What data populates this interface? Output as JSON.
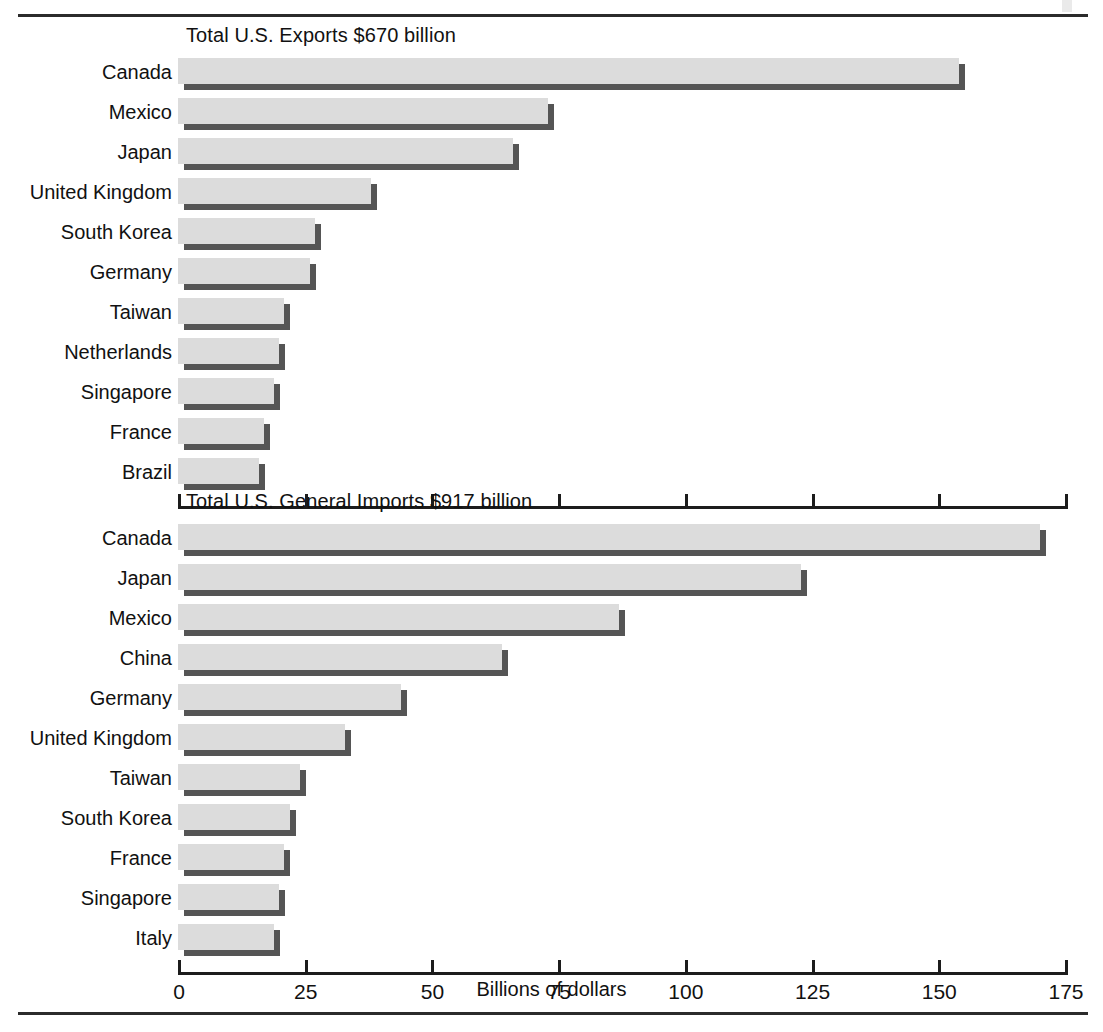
{
  "axis": {
    "title": "Billions of dollars",
    "ticks": [
      0,
      25,
      50,
      75,
      100,
      125,
      150,
      175
    ],
    "tick_labels": [
      "0",
      "25",
      "50",
      "75",
      "100",
      "125",
      "150",
      "175"
    ],
    "min": 0,
    "max": 175
  },
  "colors": {
    "bar_fill": "#dcdcdc",
    "bar_shadow": "#555555",
    "axis": "#1c1c1c",
    "rule": "#2b2b2b",
    "text": "#111111"
  },
  "charts": [
    {
      "id": "exports",
      "title": "Total U.S. Exports $670 billion",
      "total_label": "$670 billion",
      "show_tick_labels": false
    },
    {
      "id": "imports",
      "title": "Total U.S. General Imports $917 billion",
      "total_label": "$917 billion",
      "show_tick_labels": true
    }
  ],
  "chart_data": [
    {
      "type": "bar",
      "orientation": "horizontal",
      "title": "Total U.S. Exports $670 billion",
      "xlabel": "Billions of dollars",
      "ylabel": "",
      "xlim": [
        0,
        175
      ],
      "xticks": [
        0,
        25,
        50,
        75,
        100,
        125,
        150,
        175
      ],
      "grid": false,
      "legend": false,
      "categories": [
        "Canada",
        "Mexico",
        "Japan",
        "United Kingdom",
        "South Korea",
        "Germany",
        "Taiwan",
        "Netherlands",
        "Singapore",
        "France",
        "Brazil"
      ],
      "values": [
        154,
        73,
        66,
        38,
        27,
        26,
        21,
        20,
        19,
        17,
        16
      ]
    },
    {
      "type": "bar",
      "orientation": "horizontal",
      "title": "Total U.S. General Imports $917 billion",
      "xlabel": "Billions of dollars",
      "ylabel": "",
      "xlim": [
        0,
        175
      ],
      "xticks": [
        0,
        25,
        50,
        75,
        100,
        125,
        150,
        175
      ],
      "grid": false,
      "legend": false,
      "categories": [
        "Canada",
        "Japan",
        "Mexico",
        "China",
        "Germany",
        "United Kingdom",
        "Taiwan",
        "South Korea",
        "France",
        "Singapore",
        "Italy"
      ],
      "values": [
        170,
        123,
        87,
        64,
        44,
        33,
        24,
        22,
        21,
        20,
        19
      ]
    }
  ]
}
